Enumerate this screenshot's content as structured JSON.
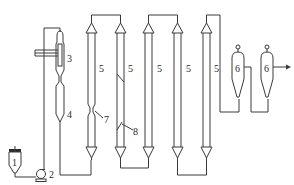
{
  "diagram": {
    "type": "process-flow",
    "line_color": "#3a3a3a",
    "labels": {
      "tank": "1",
      "pump": "2",
      "heat_exchanger": "3",
      "reactor": "4",
      "column_1": "5",
      "column_2": "5",
      "column_3": "5",
      "column_4": "5",
      "column_5": "5",
      "cyclone_1": "6",
      "cyclone_2": "6",
      "constriction": "7",
      "baffle": "8"
    }
  }
}
